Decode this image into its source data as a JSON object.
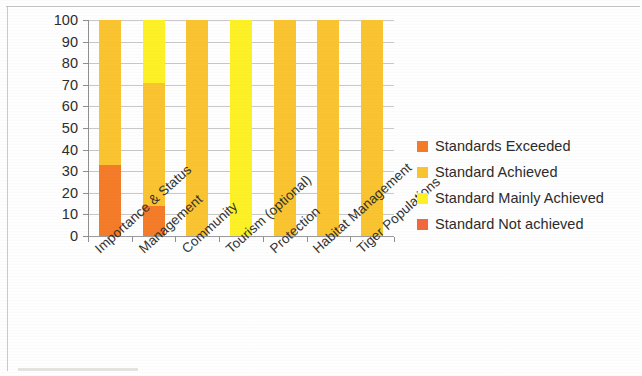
{
  "chart_data": {
    "type": "bar",
    "subtype": "stacked-bar-100",
    "title": "",
    "xlabel": "",
    "ylabel": "",
    "ylim": [
      0,
      100
    ],
    "ytick_step": 10,
    "ytick_labels": [
      "100",
      "90",
      "80",
      "70",
      "60",
      "50",
      "40",
      "30",
      "20",
      "10",
      "0"
    ],
    "grid": true,
    "legend_position": "right",
    "categories": [
      "Importance & Status",
      "Management",
      "Community",
      "Tourism (optional)",
      "Protection",
      "Habitat Management",
      "Tiger Populations"
    ],
    "series": [
      {
        "name": "Standards Exceeded",
        "color": "#F47B28",
        "values": [
          33,
          14,
          0,
          0,
          0,
          0,
          0
        ]
      },
      {
        "name": "Standard Achieved",
        "color": "#FAC430",
        "values": [
          67,
          57,
          100,
          0,
          100,
          100,
          100
        ]
      },
      {
        "name": "Standard Mainly Achieved",
        "color": "#FDF125",
        "values": [
          0,
          29,
          0,
          100,
          0,
          0,
          0
        ]
      },
      {
        "name": "Standard Not achieved",
        "color": "#F2683C",
        "values": [
          0,
          0,
          0,
          0,
          0,
          0,
          0
        ]
      }
    ]
  },
  "legend": {
    "items": [
      {
        "label": "Standards Exceeded",
        "color": "#F47B28"
      },
      {
        "label": "Standard Achieved",
        "color": "#FAC430"
      },
      {
        "label": "Standard Mainly Achieved",
        "color": "#FDF125"
      },
      {
        "label": "Standard Not achieved",
        "color": "#F2683C"
      }
    ]
  }
}
